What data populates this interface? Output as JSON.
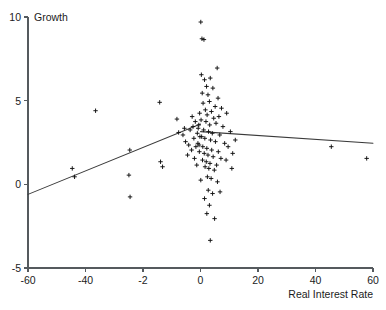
{
  "chart_data": {
    "type": "scatter",
    "title": "",
    "xlabel": "Real Interest Rate",
    "ylabel": "Growth",
    "xlim": [
      -60,
      60
    ],
    "ylim": [
      -5,
      10
    ],
    "grid": false,
    "legend": "none",
    "marker": "plus",
    "xticks": [
      -60,
      -40,
      -20,
      0,
      20,
      40,
      60
    ],
    "xtick_labels": [
      "-60",
      "-40",
      "-2",
      "0",
      "20",
      "40",
      "60"
    ],
    "yticks": [
      -5,
      0,
      5,
      10
    ],
    "ytick_labels": [
      "-5",
      "0",
      "5",
      "10"
    ],
    "points": [
      [
        -43.8,
        0.45
      ],
      [
        -44.6,
        0.95
      ],
      [
        -36.5,
        4.4
      ],
      [
        -24.6,
        2.05
      ],
      [
        -24.9,
        0.55
      ],
      [
        -24.5,
        -0.75
      ],
      [
        -14.2,
        4.9
      ],
      [
        -13.9,
        1.35
      ],
      [
        -13.2,
        1.05
      ],
      [
        -8.2,
        3.9
      ],
      [
        -7.6,
        3.1
      ],
      [
        -6.1,
        2.95
      ],
      [
        -5.6,
        3.35
      ],
      [
        -5.2,
        2.55
      ],
      [
        -4.5,
        1.75
      ],
      [
        -4.1,
        2.35
      ],
      [
        -3.6,
        3.25
      ],
      [
        -3.1,
        2.05
      ],
      [
        -2.9,
        4.05
      ],
      [
        -2.6,
        3.45
      ],
      [
        -2.3,
        2.75
      ],
      [
        -2.1,
        1.55
      ],
      [
        -1.8,
        3.75
      ],
      [
        -1.6,
        2.25
      ],
      [
        -1.3,
        1.15
      ],
      [
        -1.1,
        3.05
      ],
      [
        -0.9,
        2.45
      ],
      [
        -0.6,
        3.55
      ],
      [
        -0.4,
        1.95
      ],
      [
        -0.2,
        2.85
      ],
      [
        0.1,
        9.7
      ],
      [
        0.5,
        8.7
      ],
      [
        1.2,
        8.65
      ],
      [
        0.3,
        6.55
      ],
      [
        1.4,
        6.25
      ],
      [
        3.4,
        6.35
      ],
      [
        5.8,
        6.95
      ],
      [
        2.1,
        5.85
      ],
      [
        4.3,
        5.75
      ],
      [
        0.6,
        5.45
      ],
      [
        2.6,
        5.35
      ],
      [
        6.1,
        5.15
      ],
      [
        3.1,
        4.95
      ],
      [
        0.9,
        4.85
      ],
      [
        5.1,
        4.65
      ],
      [
        7.3,
        4.55
      ],
      [
        1.7,
        4.45
      ],
      [
        3.8,
        4.35
      ],
      [
        -0.3,
        4.25
      ],
      [
        2.3,
        4.15
      ],
      [
        6.4,
        4.05
      ],
      [
        4.6,
        3.95
      ],
      [
        0.2,
        3.85
      ],
      [
        1.9,
        3.75
      ],
      [
        5.4,
        3.65
      ],
      [
        3.2,
        3.55
      ],
      [
        7.8,
        3.45
      ],
      [
        -0.8,
        3.35
      ],
      [
        1.1,
        3.25
      ],
      [
        2.8,
        3.15
      ],
      [
        4.1,
        3.05
      ],
      [
        6.7,
        2.95
      ],
      [
        0.4,
        2.85
      ],
      [
        1.5,
        2.75
      ],
      [
        3.5,
        2.65
      ],
      [
        5.2,
        2.55
      ],
      [
        8.4,
        2.45
      ],
      [
        -0.5,
        2.35
      ],
      [
        0.8,
        2.25
      ],
      [
        2.2,
        2.15
      ],
      [
        3.9,
        2.05
      ],
      [
        6.2,
        1.95
      ],
      [
        1.3,
        1.85
      ],
      [
        2.6,
        1.75
      ],
      [
        4.4,
        1.65
      ],
      [
        7.1,
        1.55
      ],
      [
        0.7,
        1.45
      ],
      [
        2.0,
        1.35
      ],
      [
        3.3,
        1.25
      ],
      [
        5.6,
        1.15
      ],
      [
        1.6,
        1.05
      ],
      [
        2.9,
        0.95
      ],
      [
        4.8,
        0.85
      ],
      [
        8.9,
        1.45
      ],
      [
        2.4,
        0.45
      ],
      [
        3.7,
        0.35
      ],
      [
        0.1,
        0.25
      ],
      [
        5.9,
        0.15
      ],
      [
        2.7,
        -0.35
      ],
      [
        4.2,
        -0.55
      ],
      [
        1.4,
        -0.85
      ],
      [
        3.1,
        -1.25
      ],
      [
        6.8,
        -0.45
      ],
      [
        2.2,
        -1.75
      ],
      [
        4.9,
        -2.05
      ],
      [
        3.4,
        -3.35
      ],
      [
        9.6,
        2.25
      ],
      [
        10.4,
        3.15
      ],
      [
        11.2,
        1.85
      ],
      [
        12.1,
        2.65
      ],
      [
        9.1,
        4.25
      ],
      [
        10.9,
        0.95
      ],
      [
        45.5,
        2.25
      ],
      [
        57.8,
        1.55
      ]
    ],
    "fit_lines": [
      {
        "name": "upward-segment",
        "x0": -60,
        "y0": -0.6,
        "x1": 0,
        "y1": 3.6
      },
      {
        "name": "downward-segment",
        "x0": 0,
        "y0": 3.15,
        "x1": 60,
        "y1": 2.45
      }
    ]
  }
}
